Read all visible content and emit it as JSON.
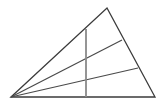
{
  "figure": {
    "name": "triangle-with-cevians",
    "canvas": {
      "width": 166,
      "height": 107,
      "background": "#ffffff"
    },
    "stroke": {
      "outline_color": "#3b3b3b",
      "outline_width": 1.3,
      "cevian_color": "#4a4a4a",
      "cevian_width": 1.2,
      "vertical_color": "#8a8a8a",
      "vertical_width": 1.8
    },
    "vertices": {
      "apex_left": {
        "x": 11,
        "y": 97
      },
      "top": {
        "x": 107,
        "y": 8
      },
      "bottom_right": {
        "x": 155,
        "y": 97
      }
    },
    "outline_path": "M 11 97 L 107 8 L 155 97 Z",
    "cevians": [
      {
        "name": "cevian-upper",
        "from": {
          "x": 11,
          "y": 97
        },
        "to": {
          "x": 122,
          "y": 40
        },
        "path": "M 11 97 L 122 40"
      },
      {
        "name": "cevian-lower",
        "from": {
          "x": 11,
          "y": 97
        },
        "to": {
          "x": 138,
          "y": 68
        },
        "path": "M 11 97 L 138 68"
      }
    ],
    "vertical_segment": {
      "name": "vertical-line",
      "from": {
        "x": 86,
        "y": 29
      },
      "to": {
        "x": 86,
        "y": 97
      },
      "path": "M 86 29 L 86 97"
    }
  }
}
